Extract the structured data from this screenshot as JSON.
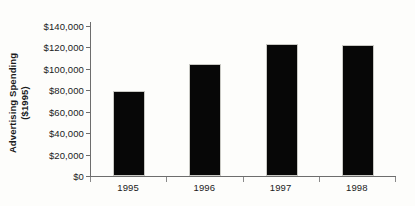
{
  "chart_data": {
    "type": "bar",
    "title": "",
    "subtitle": "",
    "xlabel": "",
    "ylabel": "Advertising Spending ($1995)",
    "ylabel_lines": [
      "Advertising Spending",
      "($1995)"
    ],
    "categories": [
      "1995",
      "1996",
      "1997",
      "1998"
    ],
    "values": [
      79000,
      105000,
      123000,
      122000
    ],
    "series": [
      {
        "name": "Advertising Spending",
        "values": [
          79000,
          105000,
          123000,
          122000
        ]
      }
    ],
    "ylim": [
      0,
      140000
    ],
    "ytick_values": [
      0,
      20000,
      40000,
      60000,
      80000,
      100000,
      120000,
      140000
    ],
    "ytick_labels": [
      "$0",
      "$20,000",
      "$40,000",
      "$60,000",
      "$80,000",
      "$100,000",
      "$120,000",
      "$140,000"
    ],
    "grid": false,
    "legend": false,
    "legend_position": "none",
    "bar_color": "#070707",
    "axis_color": "#6d6d6d",
    "background_color": "#fdfdfb",
    "annotations": []
  }
}
